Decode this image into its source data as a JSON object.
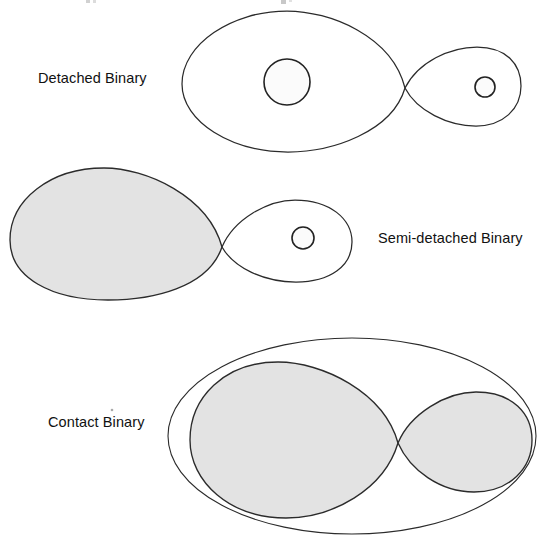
{
  "figure": {
    "background_color": "#ffffff",
    "stroke_color": "#2b2b2b",
    "fill_color": "#e3e3e3",
    "star_fill_color": "#fbfbfb",
    "label_color": "#111111",
    "width": 540,
    "height": 536
  },
  "panels": [
    {
      "id": "detached",
      "label": "Detached Binary",
      "label_x": 38,
      "label_y": 83,
      "label_side": "left",
      "primary_lobe_filled": false,
      "secondary_lobe_filled": false,
      "l1_x": 405,
      "l1_y": 88,
      "primary_star": {
        "cx": 287,
        "cy": 82,
        "r": 23
      },
      "secondary_star": {
        "cx": 485,
        "cy": 87,
        "r": 10
      },
      "primary_lobe_extent": [
        182,
        11,
        405,
        152
      ],
      "secondary_lobe_extent": [
        405,
        47,
        521,
        126
      ],
      "has_common_envelope": false
    },
    {
      "id": "semi-detached",
      "label": "Semi-detached Binary",
      "label_x": 378,
      "label_y": 243,
      "label_side": "right",
      "primary_lobe_filled": true,
      "secondary_lobe_filled": false,
      "l1_x": 222,
      "l1_y": 247,
      "primary_star": null,
      "secondary_star": {
        "cx": 303,
        "cy": 238,
        "r": 11
      },
      "primary_lobe_extent": [
        10,
        168,
        222,
        300
      ],
      "secondary_lobe_extent": [
        222,
        200,
        352,
        282
      ],
      "has_common_envelope": false
    },
    {
      "id": "contact",
      "label": "Contact Binary",
      "label_x": 48,
      "label_y": 427,
      "label_side": "left",
      "primary_lobe_filled": true,
      "secondary_lobe_filled": true,
      "l1_x": 398,
      "l1_y": 443,
      "primary_star": null,
      "secondary_star": null,
      "primary_lobe_extent": [
        190,
        362,
        398,
        518
      ],
      "secondary_lobe_extent": [
        398,
        392,
        532,
        492
      ],
      "has_common_envelope": true,
      "envelope": {
        "cx": 352,
        "cy": 436,
        "rx": 184,
        "ry": 98
      }
    }
  ]
}
